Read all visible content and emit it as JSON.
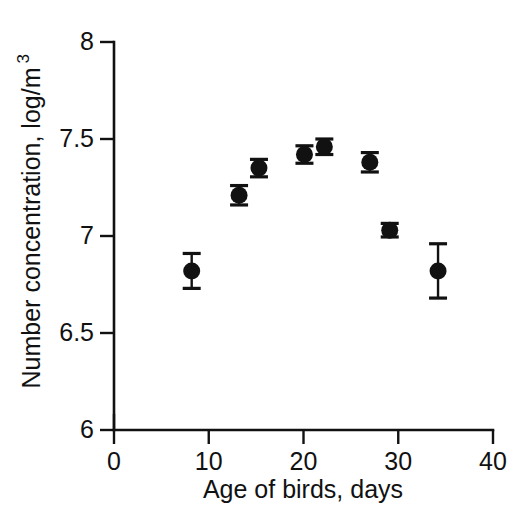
{
  "chart_data": {
    "type": "scatter",
    "title": "",
    "xlabel": "Age of birds, days",
    "ylabel": "Number concentration, log/m",
    "ylabel_superscript": "3",
    "xlim": [
      0,
      40
    ],
    "ylim": [
      6,
      8
    ],
    "xticks": [
      0,
      10,
      20,
      30,
      40
    ],
    "xticklabels": [
      "0",
      "10",
      "20",
      "30",
      "40"
    ],
    "yticks": [
      6,
      6.5,
      7,
      7.5,
      8
    ],
    "yticklabels": [
      "6",
      "6.5",
      "7",
      "7.5",
      "8"
    ],
    "grid": false,
    "legend": false,
    "marker": "filled-circle",
    "error_bars": "vertical-symmetric-with-caps",
    "color": "#111111",
    "series": [
      {
        "name": "Number concentration",
        "x": [
          8.2,
          13.2,
          15.3,
          20.1,
          22.2,
          27.0,
          29.1,
          34.2
        ],
        "y": [
          6.82,
          7.21,
          7.35,
          7.42,
          7.46,
          7.38,
          7.03,
          6.82
        ],
        "yerr": [
          0.09,
          0.05,
          0.045,
          0.045,
          0.04,
          0.05,
          0.035,
          0.14
        ]
      }
    ]
  },
  "axes": {
    "x_axis_name": "x-axis",
    "y_axis_name": "y-axis"
  }
}
